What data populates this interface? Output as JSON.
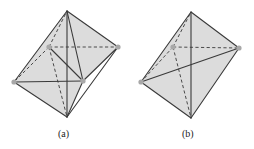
{
  "figure": {
    "panels": [
      {
        "label": "(a)",
        "description": "octahedron-like polyhedron with additional interior edges from front-right vertex",
        "vertices": {
          "top": [
            67,
            11
          ],
          "back": [
            49,
            47
          ],
          "right": [
            118,
            47
          ],
          "left": [
            14,
            82
          ],
          "front": [
            83,
            81
          ],
          "bottom": [
            67,
            117
          ]
        }
      },
      {
        "label": "(b)",
        "description": "octahedron-like polyhedron with left-right diagonal edge",
        "vertices": {
          "top": [
            191,
            12
          ],
          "back": [
            173,
            47
          ],
          "right": [
            239,
            48
          ],
          "left": [
            141,
            82
          ],
          "bottom": [
            191,
            118
          ]
        }
      }
    ],
    "colors": {
      "fill": "#dcdcdc",
      "edge": "#3a3a3a",
      "vertex_dot": "#a8a8a8"
    }
  }
}
